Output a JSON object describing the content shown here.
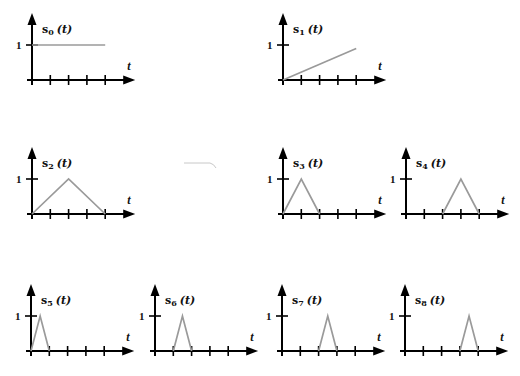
{
  "figure": {
    "y_tick_label": "1",
    "x_axis_label": "t",
    "colors": {
      "axis": "#000000",
      "signal": "#9a9a9a"
    }
  },
  "panels": [
    {
      "id": "s0",
      "label_base": "s",
      "label_sub": "0",
      "label_arg": "(t)",
      "shape": "constant",
      "points": [
        [
          0,
          1
        ],
        [
          4,
          1
        ]
      ]
    },
    {
      "id": "s1",
      "label_base": "s",
      "label_sub": "1",
      "label_arg": "(t)",
      "shape": "ramp",
      "points": [
        [
          0,
          0
        ],
        [
          4,
          0.9
        ]
      ]
    },
    {
      "id": "s2",
      "label_base": "s",
      "label_sub": "2",
      "label_arg": "(t)",
      "shape": "triangle",
      "points": [
        [
          0,
          0
        ],
        [
          2,
          1
        ],
        [
          4,
          0
        ]
      ]
    },
    {
      "id": "s3",
      "label_base": "s",
      "label_sub": "3",
      "label_arg": "(t)",
      "shape": "triangle",
      "points": [
        [
          0,
          0
        ],
        [
          1,
          1
        ],
        [
          2,
          0
        ]
      ]
    },
    {
      "id": "s4",
      "label_base": "s",
      "label_sub": "4",
      "label_arg": "(t)",
      "shape": "triangle",
      "points": [
        [
          2,
          0
        ],
        [
          3,
          1
        ],
        [
          4,
          0
        ]
      ]
    },
    {
      "id": "s5",
      "label_base": "s",
      "label_sub": "5",
      "label_arg": "(t)",
      "shape": "triangle",
      "points": [
        [
          0,
          0
        ],
        [
          0.5,
          1
        ],
        [
          1,
          0
        ]
      ]
    },
    {
      "id": "s6",
      "label_base": "s",
      "label_sub": "6",
      "label_arg": "(t)",
      "shape": "triangle",
      "points": [
        [
          1,
          0
        ],
        [
          1.5,
          1
        ],
        [
          2,
          0
        ]
      ]
    },
    {
      "id": "s7",
      "label_base": "s",
      "label_sub": "7",
      "label_arg": "(t)",
      "shape": "triangle",
      "points": [
        [
          2,
          0
        ],
        [
          2.5,
          1
        ],
        [
          3,
          0
        ]
      ]
    },
    {
      "id": "s8",
      "label_base": "s",
      "label_sub": "8",
      "label_arg": "(t)",
      "shape": "triangle",
      "points": [
        [
          3,
          0
        ],
        [
          3.5,
          1
        ],
        [
          4,
          0
        ]
      ]
    }
  ],
  "layout": {
    "tick_count": 4,
    "tick_spacing_px": 18.3,
    "unit_height_px": 35,
    "panel_origins": [
      [
        32,
        80
      ],
      [
        283,
        80
      ],
      [
        32,
        214
      ],
      [
        283,
        214
      ],
      [
        406,
        214
      ],
      [
        31,
        351
      ],
      [
        155,
        351
      ],
      [
        282,
        351
      ],
      [
        405,
        351
      ]
    ]
  }
}
